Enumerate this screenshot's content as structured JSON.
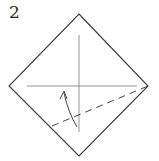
{
  "diagram": {
    "step_number": "2",
    "type": "origami-fold-step",
    "colors": {
      "outline": "#3a3a3a",
      "crease": "#7a7a7a",
      "valley_fold": "#444444",
      "arrow": "#444444",
      "background": "#ffffff"
    },
    "elements": [
      {
        "id": "paper-square",
        "shape": "diamond"
      },
      {
        "id": "vertical-crease",
        "shape": "line"
      },
      {
        "id": "horizontal-crease",
        "shape": "line"
      },
      {
        "id": "valley-fold-line",
        "shape": "dashed-line"
      },
      {
        "id": "fold-arrow",
        "shape": "curved-arrow"
      }
    ]
  }
}
